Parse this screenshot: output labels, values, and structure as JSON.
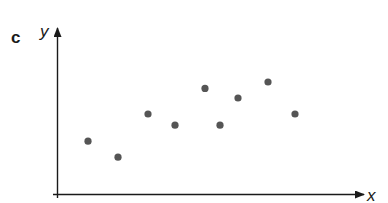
{
  "panel_label": "c",
  "chart_data": {
    "type": "scatter",
    "title": "",
    "xlabel": "x",
    "ylabel": "y",
    "xlim": [
      0,
      10
    ],
    "ylim": [
      0,
      10
    ],
    "grid": false,
    "ticks": "none",
    "point_color": "#555555",
    "points": [
      {
        "x": 1.0,
        "y": 3.3
      },
      {
        "x": 2.0,
        "y": 2.3
      },
      {
        "x": 3.0,
        "y": 5.0
      },
      {
        "x": 3.9,
        "y": 4.3
      },
      {
        "x": 4.9,
        "y": 6.6
      },
      {
        "x": 5.4,
        "y": 4.3
      },
      {
        "x": 6.0,
        "y": 6.0
      },
      {
        "x": 7.0,
        "y": 7.0
      },
      {
        "x": 7.9,
        "y": 5.0
      }
    ]
  }
}
